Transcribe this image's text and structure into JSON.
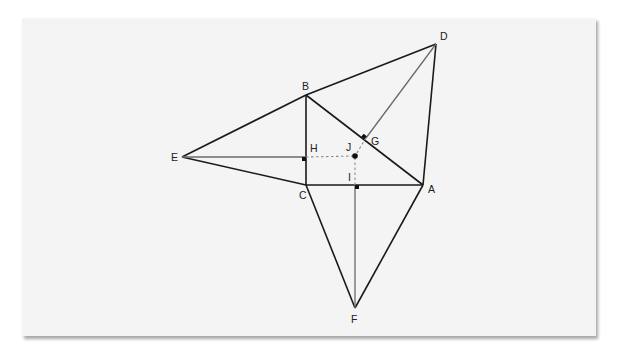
{
  "diagram": {
    "type": "geometry-construction",
    "colors": {
      "page_background": "#ffffff",
      "card_background": "#f4f4f4",
      "main_stroke": "#1a1a1a",
      "auxiliary_stroke": "#6a6a6a",
      "dashed_stroke": "#8a8a8a"
    },
    "points": {
      "A": {
        "label": "A",
        "x": 423,
        "y": 185
      },
      "B": {
        "label": "B",
        "x": 306,
        "y": 95
      },
      "C": {
        "label": "C",
        "x": 306,
        "y": 185
      },
      "D": {
        "label": "D",
        "x": 436,
        "y": 44
      },
      "E": {
        "label": "E",
        "x": 182,
        "y": 157
      },
      "F": {
        "label": "F",
        "x": 355,
        "y": 308
      },
      "G": {
        "label": "G",
        "x": 366,
        "y": 138
      },
      "H": {
        "label": "H",
        "x": 306,
        "y": 157
      },
      "I": {
        "label": "I",
        "x": 355,
        "y": 185
      },
      "J": {
        "label": "J",
        "x": 355,
        "y": 156
      }
    },
    "segments_solid": [
      [
        "A",
        "B"
      ],
      [
        "B",
        "C"
      ],
      [
        "C",
        "A"
      ],
      [
        "B",
        "D"
      ],
      [
        "D",
        "A"
      ],
      [
        "B",
        "E"
      ],
      [
        "E",
        "C"
      ],
      [
        "C",
        "F"
      ],
      [
        "F",
        "A"
      ]
    ],
    "segments_auxiliary": [
      [
        "D",
        "G"
      ],
      [
        "E",
        "H"
      ],
      [
        "F",
        "I"
      ]
    ],
    "segments_dashed": [
      [
        "H",
        "J"
      ],
      [
        "I",
        "J"
      ],
      [
        "G",
        "J"
      ]
    ],
    "right_angle_marks": [
      "G",
      "H",
      "I"
    ],
    "center_point": "J"
  }
}
